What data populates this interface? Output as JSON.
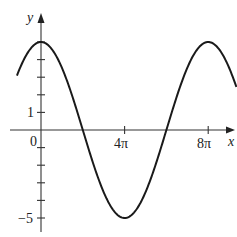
{
  "chart_data": {
    "type": "line",
    "title": "",
    "xlabel": "x",
    "ylabel": "y",
    "function": "y = 5 cos(x/4)",
    "series": [
      {
        "name": "curve",
        "x_pi_multiples": [
          -1.15,
          0,
          1,
          2,
          3,
          4,
          5,
          6,
          7,
          8,
          9.35
        ],
        "y": [
          3.1,
          5,
          3.54,
          0,
          -3.54,
          -5,
          -3.54,
          0,
          3.54,
          5,
          2.4
        ]
      }
    ],
    "x_ticks": [
      {
        "value_pi": 0,
        "label": "0"
      },
      {
        "value_pi": 4,
        "label": "4π"
      },
      {
        "value_pi": 8,
        "label": "8π"
      }
    ],
    "y_ticks": [
      {
        "value": 1,
        "label": "1"
      },
      {
        "value": -5,
        "label": "−5"
      }
    ],
    "y_tick_values": [
      -5,
      -4,
      -3,
      -2,
      -1,
      1,
      2,
      3,
      4,
      5
    ],
    "xlim_pi": [
      -1.15,
      9.35
    ],
    "ylim": [
      -5.9,
      6.4
    ],
    "grid": false,
    "legend": null
  },
  "labels": {
    "x_axis": "x",
    "y_axis": "y",
    "origin": "0",
    "tick_4pi": "4π",
    "tick_8pi": "8π",
    "tick_1": "1",
    "tick_neg5": "−5"
  },
  "colors": {
    "curve": "#1a1a1a",
    "axis": "#333333",
    "background": "#ffffff"
  }
}
